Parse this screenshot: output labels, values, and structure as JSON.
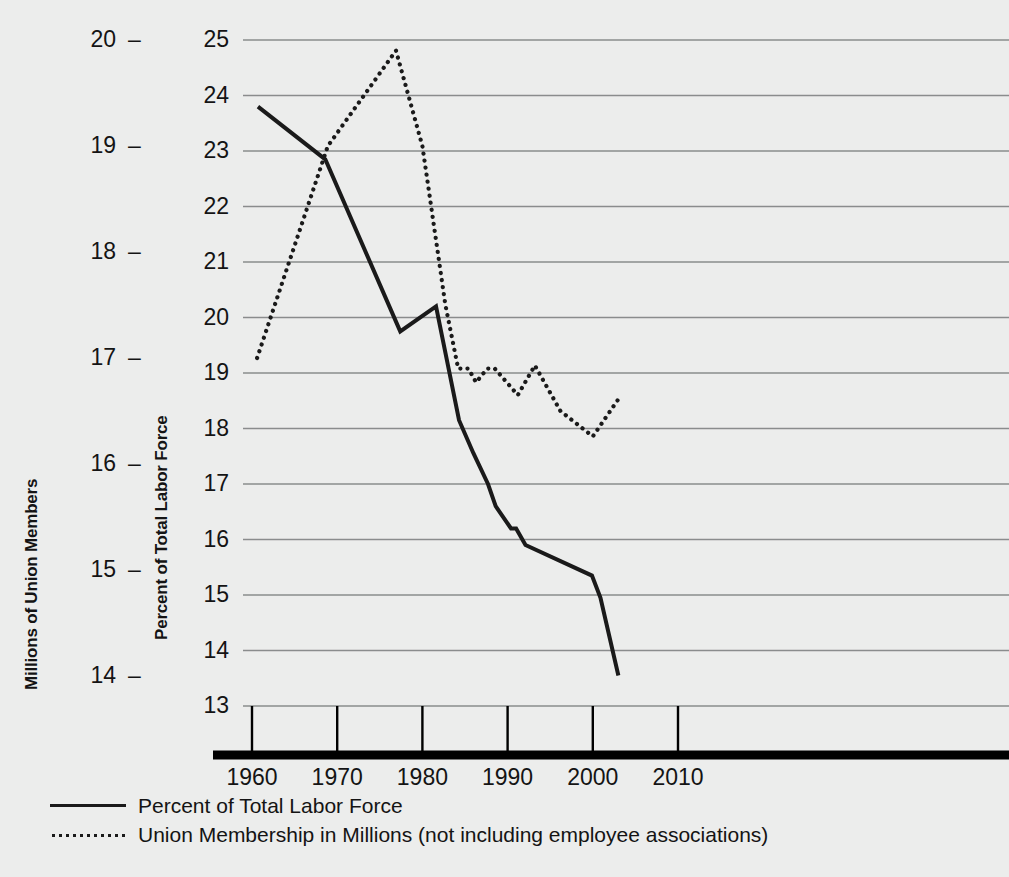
{
  "chart_data": {
    "type": "line",
    "title": "",
    "xlabel": "",
    "ylabel": "Millions of Union Members",
    "y2label": "Percent of Total Labor Force",
    "xlim": [
      1958,
      2012
    ],
    "x_ticks": [
      "1960",
      "1970",
      "1980",
      "1990",
      "2000",
      "2010"
    ],
    "x_tick_values": [
      1960,
      1970,
      1980,
      1990,
      2000,
      2010
    ],
    "left_axis": {
      "label": "Millions of Union Members",
      "ticks": [
        "20",
        "19",
        "18",
        "17",
        "16",
        "15",
        "14"
      ],
      "tick_values": [
        20,
        19,
        18,
        17,
        16,
        15,
        14
      ],
      "dash": "–",
      "ylim": [
        13.5,
        20.5
      ]
    },
    "inner_axis": {
      "label": "Percent of Total Labor Force",
      "ticks": [
        "25",
        "24",
        "23",
        "22",
        "21",
        "20",
        "19",
        "18",
        "17",
        "16",
        "15",
        "14",
        "13"
      ],
      "tick_values": [
        25,
        24,
        23,
        22,
        21,
        20,
        19,
        18,
        17,
        16,
        15,
        14,
        13
      ],
      "ylim": [
        13,
        25
      ],
      "grid": true
    },
    "series": [
      {
        "name": "Percent of Total Labor Force",
        "style": "solid",
        "axis": "percent",
        "color": "#1a1a1a",
        "points": [
          [
            1960.7,
            23.8
          ],
          [
            1968.6,
            22.85
          ],
          [
            1977.4,
            19.75
          ],
          [
            1981.6,
            20.2
          ],
          [
            1984.3,
            18.15
          ],
          [
            1986.0,
            17.55
          ],
          [
            1987.7,
            17.0
          ],
          [
            1988.6,
            16.6
          ],
          [
            1990.4,
            16.2
          ],
          [
            1991.0,
            16.2
          ],
          [
            1992.1,
            15.9
          ],
          [
            1999.9,
            15.35
          ],
          [
            2000.9,
            14.95
          ],
          [
            2003.0,
            13.55
          ]
        ]
      },
      {
        "name": "Union Membership in Millions (not including employee associations)",
        "style": "dotted",
        "axis": "millions",
        "color": "#1a1a1a",
        "points": [
          [
            1960.6,
            17.0
          ],
          [
            1968.9,
            19.0
          ],
          [
            1976.9,
            19.9
          ],
          [
            1980.0,
            19.0
          ],
          [
            1982.7,
            17.5
          ],
          [
            1984.2,
            16.9
          ],
          [
            1985.4,
            16.9
          ],
          [
            1986.3,
            16.77
          ],
          [
            1987.6,
            16.9
          ],
          [
            1988.5,
            16.9
          ],
          [
            1991.2,
            16.65
          ],
          [
            1993.2,
            16.93
          ],
          [
            1996.2,
            16.5
          ],
          [
            2000.0,
            16.26
          ],
          [
            2002.9,
            16.6
          ]
        ]
      }
    ],
    "legend": {
      "position": "below-axes",
      "entries": [
        {
          "style": "solid",
          "label": "Percent of Total Labor Force"
        },
        {
          "style": "dotted",
          "label": "Union Membership in Millions (not including employee associations)"
        }
      ]
    },
    "colors": {
      "background": "#ecedec",
      "gridline": "#8a8c8d",
      "line": "#1a1a1a",
      "axis": "#000000"
    }
  }
}
